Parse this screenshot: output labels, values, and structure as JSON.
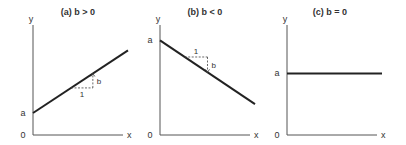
{
  "chart_data": [
    {
      "type": "line",
      "title": "(a) b > 0",
      "xlabel": "x",
      "ylabel": "y",
      "origin_label": "0",
      "intercept_label": "a",
      "run_label": "1",
      "rise_label": "b",
      "slope_sign": "positive",
      "intercept": 0.2,
      "slope": 0.57,
      "xlim": [
        0,
        1
      ],
      "ylim": [
        0,
        1
      ]
    },
    {
      "type": "line",
      "title": "(b) b < 0",
      "xlabel": "x",
      "ylabel": "y",
      "origin_label": "0",
      "intercept_label": "a",
      "run_label": "1",
      "rise_label": "b",
      "slope_sign": "negative",
      "intercept": 0.86,
      "slope": -0.58,
      "xlim": [
        0,
        1
      ],
      "ylim": [
        0,
        1
      ]
    },
    {
      "type": "line",
      "title": "(c) b = 0",
      "xlabel": "x",
      "ylabel": "y",
      "origin_label": "0",
      "intercept_label": "a",
      "slope_sign": "zero",
      "intercept": 0.56,
      "slope": 0,
      "xlim": [
        0,
        1
      ],
      "ylim": [
        0,
        1
      ]
    }
  ]
}
